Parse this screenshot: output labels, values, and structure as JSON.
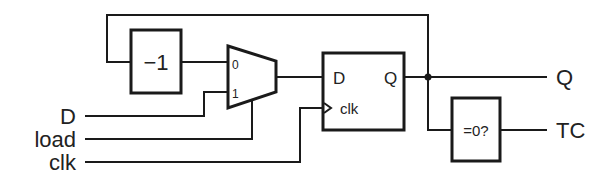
{
  "diagram": {
    "type": "circuit-schematic",
    "title": "",
    "inputs": [
      {
        "label": "D"
      },
      {
        "label": "load"
      },
      {
        "label": "clk"
      }
    ],
    "outputs": [
      {
        "label": "Q"
      },
      {
        "label": "TC"
      }
    ],
    "blocks": {
      "decrement": {
        "label": "−1"
      },
      "mux": {
        "input0_label": "0",
        "input1_label": "1"
      },
      "flipflop": {
        "d_label": "D",
        "q_label": "Q",
        "clk_label": "clk"
      },
      "zero_detect": {
        "label": "=0?"
      }
    },
    "colors": {
      "stroke": "#1a1a1a",
      "text": "#222222",
      "background": "#ffffff"
    }
  }
}
